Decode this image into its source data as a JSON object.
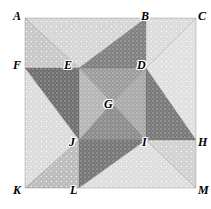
{
  "figure": {
    "type": "geometric-diagram",
    "square": {
      "left": 25,
      "top": 18,
      "right": 196,
      "bottom": 188
    },
    "points": [
      {
        "id": "A",
        "x": 25,
        "y": 18,
        "label_x": 13,
        "label_y": 10
      },
      {
        "id": "B",
        "x": 146,
        "y": 18,
        "label_x": 141,
        "label_y": 10
      },
      {
        "id": "C",
        "x": 196,
        "y": 18,
        "label_x": 198,
        "label_y": 10
      },
      {
        "id": "F",
        "x": 25,
        "y": 68,
        "label_x": 13,
        "label_y": 59
      },
      {
        "id": "E",
        "x": 79,
        "y": 68,
        "label_x": 64,
        "label_y": 59
      },
      {
        "id": "D",
        "x": 146,
        "y": 68,
        "label_x": 137,
        "label_y": 59
      },
      {
        "id": "G",
        "x": 112,
        "y": 103,
        "label_x": 104,
        "label_y": 98
      },
      {
        "id": "J",
        "x": 79,
        "y": 140,
        "label_x": 69,
        "label_y": 136
      },
      {
        "id": "I",
        "x": 146,
        "y": 140,
        "label_x": 142,
        "label_y": 136
      },
      {
        "id": "H",
        "x": 196,
        "y": 140,
        "label_x": 198,
        "label_y": 136
      },
      {
        "id": "K",
        "x": 25,
        "y": 188,
        "label_x": 13,
        "label_y": 184
      },
      {
        "id": "L",
        "x": 79,
        "y": 188,
        "label_x": 70,
        "label_y": 184
      },
      {
        "id": "M",
        "x": 196,
        "y": 188,
        "label_x": 198,
        "label_y": 184
      }
    ],
    "regions": [
      {
        "name": "region-A-B-E",
        "polygon": "25,18 146,18 79,68",
        "shade": "#d6d6d6",
        "texture": "dots-light"
      },
      {
        "name": "region-A-E-F",
        "polygon": "25,18 79,68 25,68",
        "shade": "#c8c8c8",
        "texture": "dots-light"
      },
      {
        "name": "region-B-D-E",
        "polygon": "146,18 146,68 79,68",
        "shade": "#808080",
        "texture": "dots-dark"
      },
      {
        "name": "region-B-C-D",
        "polygon": "146,18 196,18 146,68",
        "shade": "#dcdcdc",
        "texture": "dots-light"
      },
      {
        "name": "region-C-D-H",
        "polygon": "196,18 196,140 146,68",
        "shade": "#e0e0e0",
        "texture": "dots-light"
      },
      {
        "name": "region-D-H-I",
        "polygon": "146,68 196,140 146,140",
        "shade": "#787878",
        "texture": "dots-dark"
      },
      {
        "name": "region-E-D-G",
        "polygon": "79,68 146,68 112,103",
        "shade": "#9a9a9a",
        "texture": "dots-mid"
      },
      {
        "name": "region-E-G-J",
        "polygon": "79,68 112,103 79,140",
        "shade": "#b4b4b4",
        "texture": "dots-mid"
      },
      {
        "name": "region-G-D-I",
        "polygon": "112,103 146,68 146,140",
        "shade": "#a8a8a8",
        "texture": "dots-mid"
      },
      {
        "name": "region-G-I-J",
        "polygon": "112,103 146,140 79,140",
        "shade": "#8c8c8c",
        "texture": "dots-dark"
      },
      {
        "name": "region-F-E-J",
        "polygon": "25,68 79,68 79,140",
        "shade": "#6e6e6e",
        "texture": "dots-dark"
      },
      {
        "name": "region-F-J-K",
        "polygon": "25,68 79,140 25,188",
        "shade": "#dcdcdc",
        "texture": "dots-light"
      },
      {
        "name": "region-J-K-L",
        "polygon": "79,140 25,188 79,188",
        "shade": "#bcbcbc",
        "texture": "dots-light"
      },
      {
        "name": "region-J-I-L",
        "polygon": "79,140 146,140 79,188",
        "shade": "#767676",
        "texture": "dots-dark"
      },
      {
        "name": "region-I-L-M",
        "polygon": "146,140 79,188 196,188",
        "shade": "#dedede",
        "texture": "dots-light"
      },
      {
        "name": "region-I-H-M",
        "polygon": "146,140 196,140 196,188",
        "shade": "#d2d2d2",
        "texture": "dots-light"
      }
    ],
    "edges": [
      "25,18 196,18",
      "196,18 196,188",
      "196,188 25,188",
      "25,188 25,18",
      "25,18 79,68",
      "146,18 79,68",
      "146,18 146,68",
      "196,18 146,68",
      "25,68 79,68",
      "79,68 146,68",
      "146,68 196,140",
      "146,68 146,140",
      "79,68 112,103",
      "112,103 146,68",
      "112,103 79,140",
      "112,103 146,140",
      "25,68 79,140",
      "79,68 79,140",
      "79,140 146,140",
      "146,140 196,140",
      "79,140 25,188",
      "79,140 79,188",
      "146,140 79,188",
      "146,140 196,188"
    ]
  }
}
